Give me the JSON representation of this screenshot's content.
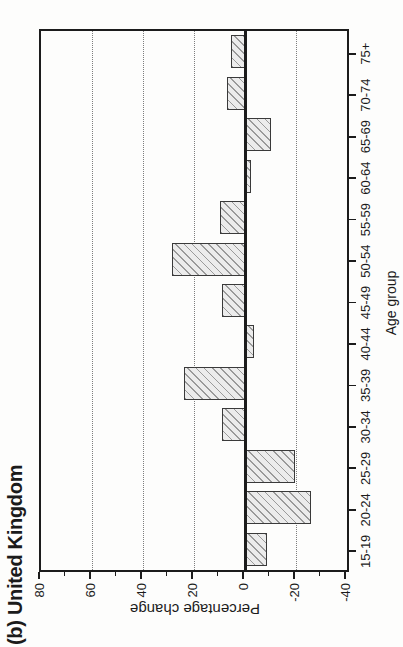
{
  "chart_data": {
    "type": "bar",
    "title": "(b) United Kingdom",
    "xlabel": "Age group",
    "ylabel": "Percentage change",
    "categories": [
      "15-19",
      "20-24",
      "25-29",
      "30-34",
      "35-39",
      "40-44",
      "45-49",
      "50-54",
      "55-59",
      "60-64",
      "65-69",
      "70-74",
      "75+"
    ],
    "values": [
      -8.5,
      -26,
      -19.5,
      9,
      24,
      -3.5,
      9,
      28.5,
      10,
      -2.5,
      -10,
      7,
      5.5
    ],
    "ylim": [
      -40,
      80
    ],
    "yticks": [
      80,
      60,
      40,
      20,
      0,
      -20,
      -40
    ],
    "ytick_labels": [
      "80",
      "60",
      "40",
      "20",
      "0",
      "-20",
      "-40"
    ],
    "minor_tick_step": 10,
    "gridlines_at": [
      60,
      40,
      20,
      -20
    ],
    "grid_style": "dotted",
    "legend": "none",
    "colors": {
      "bar_fill": "#ececec",
      "bar_hatch": "#9a9a9a",
      "bar_border": "#3a3a3a",
      "axis": "#1c1c1c",
      "grid": "#7d7d7d",
      "paper": "#fdfdfc"
    }
  }
}
